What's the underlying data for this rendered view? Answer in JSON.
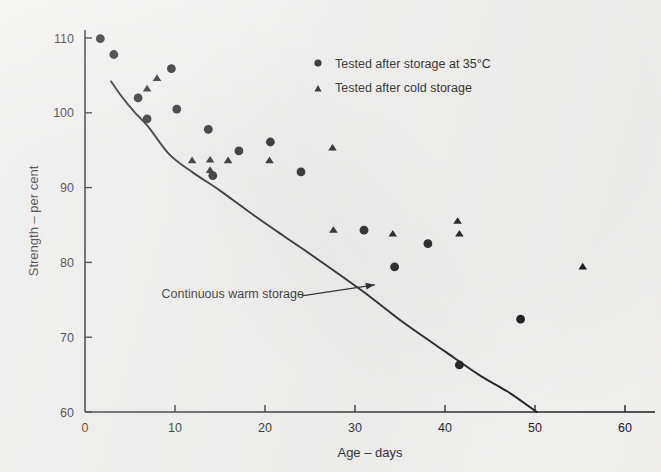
{
  "chart_data": {
    "type": "scatter",
    "title": "",
    "xlabel": "Age – days",
    "ylabel": "Strength – per cent",
    "xlim": [
      0,
      63
    ],
    "ylim": [
      60,
      112
    ],
    "grid": false,
    "xticks": [
      0,
      10,
      20,
      30,
      40,
      50,
      60
    ],
    "yticks": [
      60,
      70,
      80,
      90,
      100,
      110
    ],
    "legend_position": "top-right",
    "series": [
      {
        "name": "Tested after storage at 35°C",
        "marker": "circle",
        "color": "#111111",
        "points": [
          [
            1.7,
            109.9
          ],
          [
            3.2,
            107.8
          ],
          [
            5.9,
            102.0
          ],
          [
            6.9,
            99.2
          ],
          [
            9.6,
            105.9
          ],
          [
            10.2,
            100.5
          ],
          [
            13.7,
            97.8
          ],
          [
            14.2,
            91.6
          ],
          [
            17.1,
            94.9
          ],
          [
            20.6,
            96.1
          ],
          [
            24.0,
            92.1
          ],
          [
            31.0,
            84.3
          ],
          [
            34.4,
            79.4
          ],
          [
            38.1,
            82.5
          ],
          [
            41.6,
            66.3
          ],
          [
            48.4,
            72.4
          ]
        ]
      },
      {
        "name": "Tested after cold storage",
        "marker": "triangle",
        "color": "#111111",
        "points": [
          [
            6.9,
            103.3
          ],
          [
            8.0,
            104.7
          ],
          [
            11.9,
            93.7
          ],
          [
            13.9,
            93.8
          ],
          [
            13.9,
            92.4
          ],
          [
            15.9,
            93.7
          ],
          [
            20.5,
            93.7
          ],
          [
            27.5,
            95.4
          ],
          [
            27.6,
            84.4
          ],
          [
            34.2,
            83.9
          ],
          [
            41.4,
            85.6
          ],
          [
            41.6,
            83.9
          ],
          [
            55.3,
            79.5
          ]
        ]
      }
    ],
    "curve": {
      "label": "Continuous warm storage",
      "points": [
        [
          2.9,
          104.2
        ],
        [
          4.0,
          102.3
        ],
        [
          5.5,
          100.1
        ],
        [
          7.0,
          98.2
        ],
        [
          9.4,
          94.4
        ],
        [
          12.0,
          92.0
        ],
        [
          15.0,
          89.6
        ],
        [
          18.3,
          86.7
        ],
        [
          22.0,
          83.6
        ],
        [
          26.0,
          80.3
        ],
        [
          30.9,
          76.1
        ],
        [
          35.0,
          72.3
        ],
        [
          40.0,
          68.1
        ],
        [
          44.0,
          64.8
        ],
        [
          47.0,
          62.7
        ],
        [
          50.2,
          60.0
        ]
      ]
    },
    "annotation": {
      "text": "Continuous warm storage",
      "text_x": 8.5,
      "text_y": 75.3,
      "arrow_from_x": 29.2,
      "arrow_from_y": 75.0,
      "arrow_to_x": 32.2,
      "arrow_to_y": 77.0
    }
  },
  "axes": {
    "x_title": "Age – days",
    "y_title": "Strength – per cent",
    "x_tick_labels": [
      "0",
      "10",
      "20",
      "30",
      "40",
      "50",
      "60"
    ],
    "y_tick_labels": [
      "60",
      "70",
      "80",
      "90",
      "100",
      "110"
    ]
  },
  "legend": {
    "entries": [
      {
        "label": "Tested after storage at 35°C",
        "marker": "circle-marker"
      },
      {
        "label": "Tested after cold storage",
        "marker": "triangle-marker"
      }
    ]
  },
  "colors": {
    "ink": "#111111",
    "paper": "#f2f1ef"
  }
}
